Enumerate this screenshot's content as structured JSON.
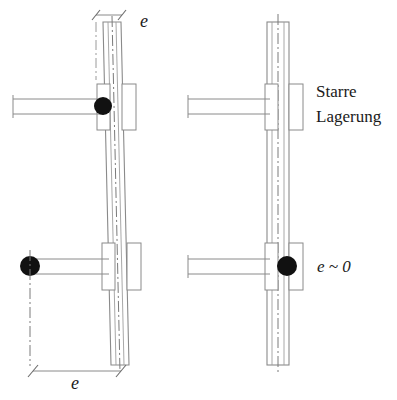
{
  "figure": {
    "background_color": "#ffffff",
    "line_color": "#8a8a8a",
    "dark_line_color": "#555555",
    "marker_color": "#111111",
    "text_color": "#1a1a1a"
  },
  "labels": {
    "top_e": "e",
    "bottom_e": "e",
    "rigid_bearing_line1": "Starre",
    "rigid_bearing_line2": "Lagerung",
    "e_approx_zero": "e ~ 0"
  },
  "assemblies": [
    {
      "id": "left-assembly",
      "name": "tilted-column-eccentric-bearing",
      "column_tilt": "tilted",
      "upper_bearing": {
        "has_marker": true,
        "marker_position": "at-column-left-face",
        "shaft_side": "left"
      },
      "lower_bearing": {
        "has_marker": true,
        "marker_position": "at-shaft-far-end",
        "shaft_side": "left"
      },
      "dimensions": [
        {
          "name": "top-offset",
          "label": "e",
          "span": "small"
        },
        {
          "name": "bottom-offset",
          "label": "e",
          "span": "large"
        }
      ]
    },
    {
      "id": "right-assembly",
      "name": "straight-column-rigid-bearing",
      "column_tilt": "vertical",
      "upper_bearing": {
        "has_marker": false,
        "marker_position": "none",
        "shaft_side": "left"
      },
      "lower_bearing": {
        "has_marker": true,
        "marker_position": "at-column-center",
        "shaft_side": "left"
      },
      "annotations": [
        {
          "name": "rigid-bearing-annotation",
          "text": "Starre Lagerung"
        },
        {
          "name": "eccentricity-annotation",
          "text": "e ~ 0"
        }
      ]
    }
  ]
}
